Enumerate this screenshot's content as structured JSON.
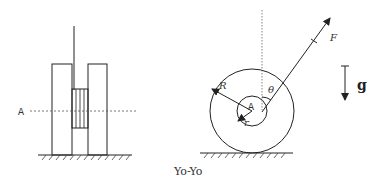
{
  "caption": "Yo-Yo",
  "side_view": {
    "axis_label": "A"
  },
  "front_view": {
    "center_label": "A",
    "outer_radius_label": "R",
    "inner_radius_label": "r",
    "angle_label": "θ",
    "force_label": "F"
  },
  "gravity": {
    "label": "g"
  },
  "colors": {
    "line": "#222222",
    "dotted": "#555555"
  }
}
